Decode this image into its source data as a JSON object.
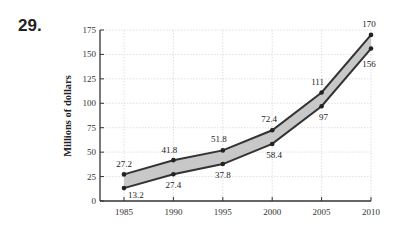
{
  "problem_number": "29.",
  "chart_data": {
    "type": "area",
    "title": "",
    "xlabel": "",
    "ylabel": "Millions of dollars",
    "x": [
      1985,
      1990,
      1995,
      2000,
      2005,
      2010
    ],
    "series": [
      {
        "name": "upper",
        "values": [
          27.2,
          41.8,
          51.8,
          72.4,
          111,
          170
        ]
      },
      {
        "name": "lower",
        "values": [
          13.2,
          27.4,
          37.8,
          58.4,
          97,
          156
        ]
      }
    ],
    "fill_between": true,
    "ylim": [
      0,
      175
    ],
    "xlim": [
      1982.5,
      2010
    ],
    "yticks": [
      0,
      25,
      50,
      75,
      100,
      125,
      150,
      175
    ],
    "xticks": [
      1985,
      1990,
      1995,
      2000,
      2005,
      2010
    ],
    "grid": true,
    "legend": null,
    "colors": {
      "line": "#333333",
      "fill": "#c8c8c8",
      "grid": "#d8d8d8"
    }
  }
}
